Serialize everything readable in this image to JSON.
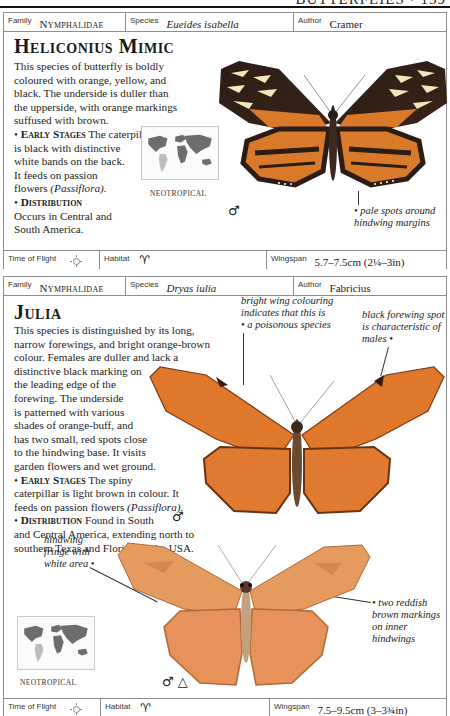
{
  "page": {
    "running_title": "BUTTERFLIES • 159"
  },
  "entries": [
    {
      "family_label": "Family",
      "family": "Nymphalidae",
      "species_label": "Species",
      "species": "Eueides isabella",
      "author_label": "Author",
      "author": "Cramer",
      "title": "Heliconius Mimic",
      "text_lines": [
        "This species of butterfly is boldly",
        "coloured with orange, yellow, and",
        "black. The underside is duller than",
        "the upperside, with orange markings",
        "suffused with brown."
      ],
      "early_stages_heading": "Early Stages",
      "early_stages_lines": [
        " The caterpillar",
        "is black with distinctive",
        "white bands on the back.",
        "It feeds on passion",
        "flowers "
      ],
      "early_stages_plant": "(Passiflora).",
      "distribution_heading": "Distribution",
      "distribution_lines": [
        "Occurs in Central and",
        "South America."
      ],
      "region": "NEOTROPICAL",
      "annotations": [
        {
          "text_lines": [
            "pale spots around",
            "hindwing margins"
          ]
        }
      ],
      "sex_symbols": "♂",
      "time_of_flight_label": "Time of Flight",
      "time_of_flight_icon": "sun-icon",
      "habitat_label": "Habitat",
      "habitat_icon": "palm-tree-icon",
      "habitat_glyph": "𐀀",
      "wingspan_label": "Wingspan",
      "wingspan": "5.7–7.5cm (2¼–3in)",
      "colors": {
        "wing_black": "#2b1d16",
        "wing_orange": "#d9792a",
        "wing_yellow": "#f2e7b8"
      }
    },
    {
      "family_label": "Family",
      "family": "Nymphalidae",
      "species_label": "Species",
      "species": "Dryas iulia",
      "author_label": "Author",
      "author": "Fabricius",
      "title": "Julia",
      "text_lines": [
        "This species is distinguished by its long,",
        "narrow forewings, and bright orange-brown",
        "colour. Females are duller and lack a",
        "distinctive black marking on",
        "the leading edge of the",
        "forewing. The underside",
        "is patterned with various",
        "shades of orange-buff, and",
        "has two small, red spots close",
        "to the hindwing base. It visits",
        "garden flowers and wet ground."
      ],
      "early_stages_heading": "Early Stages",
      "early_stages_lines": [
        " The spiny",
        "caterpillar is light brown in colour. It",
        "feeds on passion flowers "
      ],
      "early_stages_plant": "(Passiflora).",
      "distribution_heading": "Distribution",
      "distribution_lines": [
        " Found in South",
        "and Central America, extending north to",
        "southern Texas and Florida, in the USA."
      ],
      "region": "NEOTROPICAL",
      "annotations": [
        {
          "text_lines": [
            "bright wing colouring",
            "indicates that this is",
            "a poisonous species"
          ]
        },
        {
          "text_lines": [
            "black forewing spot",
            "is characteristic of",
            "males"
          ]
        },
        {
          "text_lines": [
            "hindwing",
            "fringe with",
            "white area"
          ]
        },
        {
          "text_lines": [
            "two reddish",
            "brown markings",
            "on inner",
            "hindwings"
          ]
        }
      ],
      "sex_symbols_upper": "♂",
      "sex_symbols_lower": "♂ △",
      "time_of_flight_label": "Time of Flight",
      "time_of_flight_icon": "sun-icon",
      "habitat_label": "Habitat",
      "habitat_icon": "palm-tree-icon",
      "wingspan_label": "Wingspan",
      "wingspan": "7.5–9.5cm (3–3¾in)",
      "colors": {
        "wing_orange": "#e0782b",
        "wing_dark": "#7a3a14",
        "underside": "#e59a5e"
      }
    }
  ]
}
